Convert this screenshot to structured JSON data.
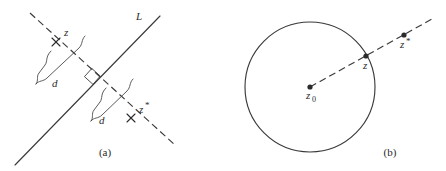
{
  "figure": {
    "background_color": "#ffffff",
    "ink_color": "#3a3a3a",
    "width": 446,
    "height": 171
  },
  "panel_a": {
    "caption": "(a)",
    "line_label": "L",
    "point_z_label": "z",
    "point_zstar_label": "z",
    "point_zstar_superscript": "*",
    "distance_label_upper": "d",
    "distance_label_lower": "d",
    "right_angle_marker": "right-angle-square",
    "description_elements": {
      "solid_line": "mirror-line-L",
      "dashed_line": "perpendicular-through-z-and-zstar"
    }
  },
  "panel_b": {
    "caption": "(b)",
    "center_label": "z",
    "center_subscript": "0",
    "point_z_label": "z",
    "point_zstar_label": "z",
    "point_zstar_superscript": "*",
    "description_elements": {
      "circle": "inversion-circle",
      "dashed_ray": "ray-from-center-through-z-and-zstar"
    }
  }
}
